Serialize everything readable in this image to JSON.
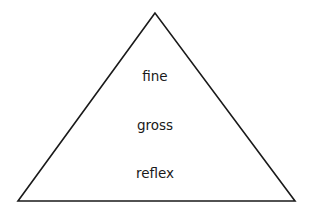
{
  "diagram": {
    "type": "pyramid",
    "shape": {
      "apex": [
        155,
        13
      ],
      "base_left": [
        18,
        201
      ],
      "base_right": [
        295,
        201
      ],
      "stroke_color": "#1a1a1a",
      "fill_color": "#ffffff"
    },
    "levels": [
      {
        "label": "fine",
        "position": "top"
      },
      {
        "label": "gross",
        "position": "middle"
      },
      {
        "label": "reflex",
        "position": "bottom"
      }
    ]
  }
}
